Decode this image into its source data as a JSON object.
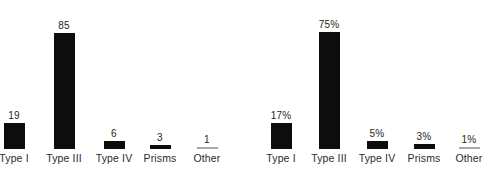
{
  "figure": {
    "background_color": "#ffffff",
    "bar_color": "#0d0d0d",
    "hairline_color": "#a8a8a8",
    "label_color": "#2b2b2b"
  },
  "chart_data": [
    {
      "type": "bar",
      "title": "",
      "subtitle": "",
      "xlabel": "",
      "ylabel": "",
      "grid": false,
      "legend": "none",
      "ylim": [
        0,
        92
      ],
      "categories": [
        "Type I",
        "Type III",
        "Type IV",
        "Prisms",
        "Other"
      ],
      "values": [
        19,
        85,
        6,
        3,
        1
      ],
      "data_labels": [
        "19",
        "85",
        "6",
        "3",
        "1"
      ]
    },
    {
      "type": "bar",
      "title": "",
      "subtitle": "",
      "xlabel": "",
      "ylabel": "",
      "grid": false,
      "legend": "none",
      "ylim": [
        0,
        81
      ],
      "categories": [
        "Type I",
        "Type III",
        "Type IV",
        "Prisms",
        "Other"
      ],
      "values": [
        17,
        75,
        5,
        3,
        1
      ],
      "data_labels": [
        "17%",
        "75%",
        "5%",
        "3%",
        "1%"
      ]
    }
  ]
}
